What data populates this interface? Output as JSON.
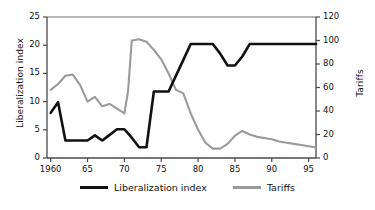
{
  "chart_data": {
    "type": "line",
    "title": "",
    "xlabel": "",
    "ylabel": "Liberalization index",
    "y2label": "Tariffs",
    "grid": false,
    "legend_position": "bottom-center",
    "xlim": [
      1959.5,
      1996
    ],
    "ylim": [
      0,
      25
    ],
    "y2lim": [
      0,
      120
    ],
    "x_ticks": [
      1960,
      1965,
      1970,
      1975,
      1980,
      1985,
      1990,
      1995
    ],
    "x_tick_labels": [
      "1960",
      "65",
      "70",
      "75",
      "80",
      "85",
      "90",
      "95"
    ],
    "y_ticks": [
      0,
      5,
      10,
      15,
      20,
      25
    ],
    "y_tick_labels": [
      "0",
      "5",
      "10",
      "15",
      "20",
      "25"
    ],
    "y2_ticks": [
      0,
      20,
      40,
      60,
      80,
      100,
      120
    ],
    "y2_tick_labels": [
      "0",
      "20",
      "40",
      "60",
      "80",
      "100",
      "120"
    ],
    "x": [
      1960,
      1961,
      1962,
      1963,
      1964,
      1965,
      1966,
      1967,
      1968,
      1969,
      1970,
      1971,
      1972,
      1973,
      1974,
      1975,
      1976,
      1977,
      1978,
      1979,
      1980,
      1981,
      1982,
      1983,
      1984,
      1985,
      1986,
      1987,
      1988,
      1989,
      1990,
      1991,
      1992,
      1993,
      1994,
      1995,
      1996
    ],
    "series": [
      {
        "name": "Liberalization index",
        "axis": "left",
        "color": "#111111",
        "values": [
          8.0,
          9.9,
          3.1,
          3.1,
          3.1,
          3.1,
          4.0,
          3.1,
          4.1,
          5.1,
          5.1,
          3.6,
          1.9,
          1.9,
          11.8,
          11.8,
          11.8,
          14.6,
          17.4,
          20.2,
          20.2,
          20.2,
          20.2,
          18.5,
          16.4,
          16.4,
          18.0,
          20.2,
          20.2,
          20.2,
          20.2,
          20.2,
          20.2,
          20.2,
          20.2,
          20.2,
          20.2
        ]
      },
      {
        "name": "Tariffs",
        "axis": "right",
        "color": "#9a9a9a",
        "values": [
          58.0,
          63.0,
          70.0,
          71.0,
          66.0,
          47.0,
          50.0,
          43.0,
          44.0,
          41.0,
          38.0,
          38.0,
          57.0,
          101.0,
          101.0,
          95.0,
          93.0,
          88.0,
          78.0,
          60.0,
          53.0,
          40.0,
          28.0,
          15.0,
          9.0,
          8.0,
          8.0,
          10.0,
          17.0,
          22.0,
          24.0,
          20.0,
          20.0,
          18.0,
          16.0,
          14.0,
          13.0
        ]
      }
    ],
    "series_b_x": [
      1960,
      1961,
      1962,
      1963,
      1964,
      1965,
      1966,
      1967,
      1968,
      1969,
      1970,
      1970.5,
      1971,
      1972,
      1973,
      1974,
      1975,
      1976,
      1977,
      1978,
      1979,
      1980,
      1981,
      1982,
      1983,
      1984,
      1985,
      1986,
      1987,
      1988,
      1989,
      1990,
      1991,
      1992,
      1993,
      1994,
      1995,
      1996
    ],
    "series_b_values": [
      58.0,
      63.0,
      70.0,
      71.0,
      62.0,
      48.0,
      52.0,
      44.0,
      46.0,
      42.0,
      38.0,
      57.0,
      100.0,
      101.0,
      99.0,
      92.0,
      84.0,
      72.0,
      58.0,
      55.0,
      38.0,
      24.0,
      13.0,
      8.0,
      8.0,
      12.0,
      19.0,
      23.0,
      20.0,
      18.0,
      17.0,
      16.0,
      14.0,
      13.0,
      12.0,
      11.0,
      10.0,
      9.0
    ]
  },
  "legend": {
    "entries": [
      {
        "label": "Liberalization index",
        "color": "#111111"
      },
      {
        "label": "Tariffs",
        "color": "#9a9a9a"
      }
    ]
  },
  "axes": {
    "left_title": "Liberalization index",
    "right_title": "Tariffs"
  }
}
